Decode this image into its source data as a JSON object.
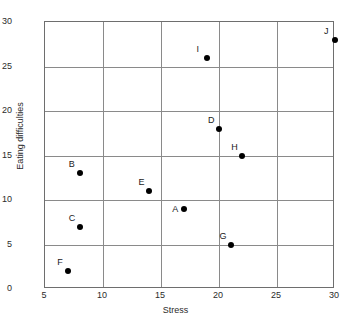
{
  "chart_data": {
    "type": "scatter",
    "title": "",
    "xlabel": "Stress",
    "ylabel": "Eating difficulties",
    "xlim": [
      5,
      30
    ],
    "ylim": [
      0,
      30
    ],
    "xticks": [
      5,
      10,
      15,
      20,
      25,
      30
    ],
    "yticks": [
      0,
      5,
      10,
      15,
      20,
      25,
      30
    ],
    "xtick_labels": [
      "5",
      "10",
      "15",
      "20",
      "25",
      "30"
    ],
    "ytick_labels": [
      "0",
      "5",
      "10",
      "15",
      "20",
      "25",
      "30"
    ],
    "grid": true,
    "legend": "none",
    "marker_color": "#000000",
    "grid_color": "#8a8a8a",
    "axis_color": "#6e6e6e",
    "points": [
      {
        "label": "A",
        "x": 17,
        "y": 9,
        "label_pos": "left"
      },
      {
        "label": "B",
        "x": 8,
        "y": 13,
        "label_pos": "upper-left"
      },
      {
        "label": "C",
        "x": 8,
        "y": 7,
        "label_pos": "upper-left"
      },
      {
        "label": "D",
        "x": 20,
        "y": 18,
        "label_pos": "upper-left"
      },
      {
        "label": "E",
        "x": 14,
        "y": 11,
        "label_pos": "upper-left"
      },
      {
        "label": "F",
        "x": 7,
        "y": 2,
        "label_pos": "upper-left"
      },
      {
        "label": "G",
        "x": 21,
        "y": 5,
        "label_pos": "upper-left"
      },
      {
        "label": "H",
        "x": 22,
        "y": 15,
        "label_pos": "upper-left"
      },
      {
        "label": "I",
        "x": 19,
        "y": 26,
        "label_pos": "upper-left"
      },
      {
        "label": "J",
        "x": 30,
        "y": 28,
        "label_pos": "upper-left"
      }
    ]
  }
}
